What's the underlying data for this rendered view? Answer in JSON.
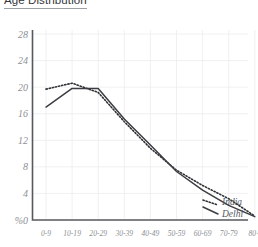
{
  "chart": {
    "title": "Age Distribution"
  },
  "legend": {
    "india_label": "India",
    "delhi_label": "Delhi"
  },
  "axes": {
    "y_ticks": [
      "28",
      "24",
      "20",
      "16",
      "12",
      "8",
      "4",
      "%0"
    ],
    "x_ticks": [
      "0-9",
      "10-19",
      "20-29",
      "30-39",
      "40-49",
      "50-59",
      "60-69",
      "70-79",
      "80+"
    ]
  },
  "colors": {
    "series_india": "#2f3135",
    "series_delhi": "#3c3e43",
    "axis": "#55585e",
    "grid": "#ececef",
    "tick_text": "#8d8f94",
    "title_text": "#33353a",
    "background": "#ffffff"
  },
  "chart_data": {
    "type": "line",
    "title": "Age Distribution",
    "xlabel": "",
    "ylabel": "%",
    "categories": [
      "0-9",
      "10-19",
      "20-29",
      "30-39",
      "40-49",
      "50-59",
      "60-69",
      "70-79",
      "80+"
    ],
    "series": [
      {
        "name": "India",
        "style": "dotted",
        "values": [
          19.7,
          20.6,
          19.2,
          14.8,
          10.8,
          7.5,
          5.2,
          3.2,
          0.6
        ]
      },
      {
        "name": "Delhi",
        "style": "solid",
        "values": [
          17.0,
          19.8,
          19.8,
          15.2,
          11.3,
          7.3,
          4.5,
          2.2,
          0.5
        ]
      }
    ],
    "ylim": [
      0,
      29.5
    ],
    "y_tick_values": [
      28,
      24,
      20,
      16,
      12,
      8,
      4,
      0
    ],
    "grid": true,
    "legend_position": "right-inside-bottom"
  }
}
